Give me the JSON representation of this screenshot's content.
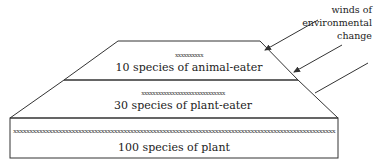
{
  "diagram": {
    "annotation": {
      "lines": [
        "winds of",
        "environmental",
        "change"
      ]
    },
    "tiers": [
      {
        "id": "top",
        "marks": "xxxxxxxxxx",
        "label": "10 species of animal-eater"
      },
      {
        "id": "middle",
        "marks": "xxxxxxxxxxxxxxxxxxxxxxxxxxxxxx",
        "label": "30 species of plant-eater"
      },
      {
        "id": "bottom",
        "marks": "xxxxxxxxxxxxxxxxxxxxxxxxxxxxxxxxxxxxxxxxxxxxxxxxxxxxxxxxxxxxxxxxxxxxxxxxxxxxxxxxxxxxxxxxxxxxxxxxxxx",
        "label": "100 species of plant"
      }
    ],
    "arrows": 3
  }
}
